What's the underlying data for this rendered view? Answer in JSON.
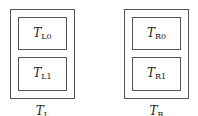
{
  "diagram": {
    "groups": [
      {
        "id": "left",
        "label": {
          "base": "T",
          "sub": "L"
        },
        "boxes": [
          {
            "base": "T",
            "sub": "L0"
          },
          {
            "base": "T",
            "sub": "L1"
          }
        ]
      },
      {
        "id": "right",
        "label": {
          "base": "T",
          "sub": "R"
        },
        "boxes": [
          {
            "base": "T",
            "sub": "R0"
          },
          {
            "base": "T",
            "sub": "R1"
          }
        ]
      }
    ],
    "colors": {
      "stroke": "#555555",
      "background": "#ffffff",
      "text": "#222222"
    }
  }
}
